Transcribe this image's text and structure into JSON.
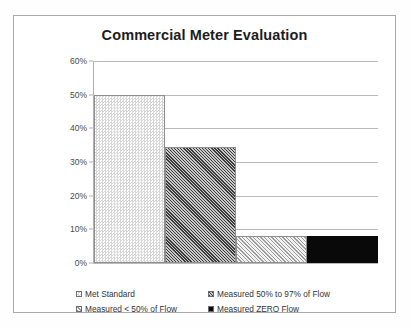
{
  "chart_data": {
    "type": "bar",
    "title": "Commercial Meter Evaluation",
    "xlabel": "",
    "ylabel": "",
    "ylim": [
      0,
      60
    ],
    "ytick_labels": [
      "60%",
      "50%",
      "40%",
      "30%",
      "20%",
      "10%",
      "0%"
    ],
    "ytick_values": [
      60,
      50,
      40,
      30,
      20,
      10,
      0
    ],
    "grid": true,
    "legend_position": "bottom",
    "categories": [
      "Met Standard",
      "Measured 50% to 97% of Flow",
      "Measured < 50% of Flow",
      "Measured ZERO Flow"
    ],
    "values": [
      50,
      34.5,
      8,
      8
    ],
    "value_labels": [
      "50%",
      "34.5%",
      "8%",
      "8%"
    ],
    "fills": [
      "light-dotted",
      "dark-diagonal-hatch",
      "light-diagonal-hatch",
      "solid-black"
    ],
    "colors": [
      "#d7d7d7",
      "#3a3a3a",
      "#9b9b9b",
      "#090909"
    ]
  },
  "legend": {
    "entries": [
      {
        "label": "Met Standard"
      },
      {
        "label": "Measured 50% to 97% of Flow"
      },
      {
        "label": "Measured < 50% of Flow"
      },
      {
        "label": "Measured ZERO Flow"
      }
    ]
  }
}
